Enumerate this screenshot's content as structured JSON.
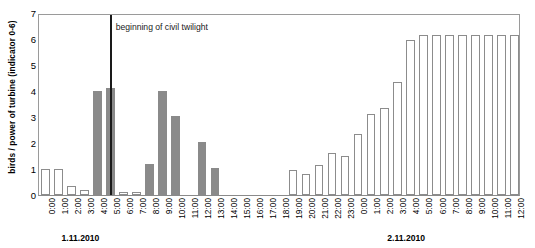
{
  "chart_data": {
    "type": "bar",
    "title": "",
    "xlabel": "",
    "ylabel": "birds / power of turbine (indicator 0-6)",
    "ylim": [
      0,
      7
    ],
    "yticks": [
      0,
      1,
      2,
      3,
      4,
      5,
      6,
      7
    ],
    "grid": false,
    "legend": null,
    "categories": [
      "0:00",
      "1:00",
      "2:00",
      "3:00",
      "4:00",
      "5:00",
      "6:00",
      "7:00",
      "8:00",
      "9:00",
      "10:00",
      "11:00",
      "12:00",
      "13:00",
      "14:00",
      "15:00",
      "16:00",
      "17:00",
      "18:00",
      "19:00",
      "20:00",
      "21:00",
      "22:00",
      "23:00",
      "0:00",
      "1:00",
      "2:00",
      "3:00",
      "4:00",
      "5:00",
      "6:00",
      "7:00",
      "8:00",
      "9:00",
      "10:00",
      "11:00",
      "12:00"
    ],
    "series": [
      {
        "name": "birds (open bars)",
        "style": "open",
        "values": [
          1.0,
          1.0,
          0.35,
          0.2,
          0,
          0.12,
          0.12,
          0.12,
          0.22,
          0,
          0,
          0,
          0,
          0,
          0,
          0,
          0,
          0,
          0,
          0.95,
          0.8,
          1.15,
          1.6,
          1.5,
          2.35,
          3.1,
          3.35,
          4.35,
          5.95,
          6.15,
          6.15,
          6.15,
          6.15,
          6.15,
          6.15,
          6.15,
          6.15
        ]
      },
      {
        "name": "power of turbine (filled bars)",
        "style": "filled",
        "values": [
          0,
          0,
          0,
          0,
          4.0,
          4.1,
          0,
          0,
          1.2,
          4.0,
          3.05,
          0,
          2.05,
          1.05,
          0,
          0,
          0,
          0,
          0,
          0,
          0,
          0,
          0,
          0,
          0,
          0,
          0,
          0,
          0,
          0,
          0,
          0,
          0,
          0,
          0,
          0,
          0
        ]
      }
    ],
    "annotations": [
      {
        "name": "civil-twilight",
        "label": "beginning of civil twilight",
        "at_category_index": 5
      }
    ],
    "day_labels": [
      {
        "text": "1.11.2010",
        "at_category_index": 3
      },
      {
        "text": "2.11.2010",
        "at_category_index": 28
      }
    ]
  }
}
